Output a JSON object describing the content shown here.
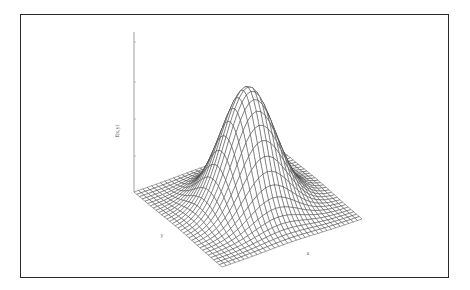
{
  "chart_data": {
    "type": "surface",
    "title": "",
    "function": "f(x,y) = exp(-(x^2 + y^2) / (2*sigma^2))",
    "sigma": 1.0,
    "xlabel": "x",
    "ylabel": "y",
    "zlabel": "f(x,y)",
    "x_range": [
      -3,
      3
    ],
    "y_range": [
      -3,
      3
    ],
    "z_range": [
      0,
      1.4
    ],
    "grid_divisions": 32,
    "z_ticks_count": 4,
    "peak": {
      "x": 0,
      "y": 0,
      "z": 1.0
    },
    "style": "wireframe",
    "line_color": "#333333",
    "projection": {
      "origin_left": [
        134,
        192
      ],
      "front_corner": [
        222,
        267
      ],
      "right_corner": [
        362,
        219
      ],
      "z_axis_top": [
        134,
        32
      ],
      "peak_screen": [
        253,
        87
      ]
    }
  },
  "labels": {
    "z_axis": "f(x,y)",
    "x_axis": "x",
    "y_axis": "y"
  }
}
